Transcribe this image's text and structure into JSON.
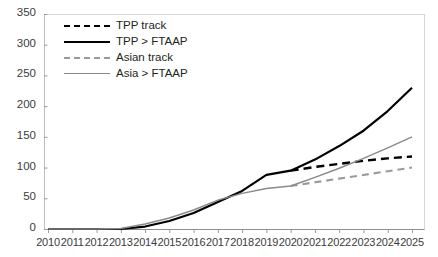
{
  "figure": {
    "clipped_title": "",
    "background_color": "#ffffff"
  },
  "legend": {
    "position": "top-left-inside",
    "items": [
      {
        "label": "TPP track",
        "style": "dashed",
        "color": "#000000",
        "key": "k-dash-black"
      },
      {
        "label": "TPP > FTAAP",
        "style": "solid",
        "color": "#000000",
        "key": "k-solid-black"
      },
      {
        "label": "Asian track",
        "style": "dashed",
        "color": "#9a9a9a",
        "key": "k-dash-gray"
      },
      {
        "label": "Asia > FTAAP",
        "style": "solid",
        "color": "#8a8a8a",
        "key": "k-solid-gray"
      }
    ]
  },
  "axes": {
    "y_ticks": [
      "350",
      "300",
      "250",
      "200",
      "150",
      "100",
      "50",
      "0"
    ],
    "x_ticks": [
      "2010",
      "2011",
      "2012",
      "2013",
      "2014",
      "2015",
      "2016",
      "2017",
      "2018",
      "2019",
      "2020",
      "2021",
      "2022",
      "2023",
      "2024",
      "2025"
    ]
  },
  "chart_data": {
    "type": "line",
    "title": "",
    "xlabel": "",
    "ylabel": "",
    "xlim": [
      2010,
      2025
    ],
    "ylim": [
      0,
      350
    ],
    "y_tick_step": 50,
    "grid": false,
    "legend_position": "top-left-inside",
    "x": [
      2010,
      2011,
      2012,
      2013,
      2014,
      2015,
      2016,
      2017,
      2018,
      2019,
      2020,
      2021,
      2022,
      2023,
      2024,
      2025
    ],
    "series": [
      {
        "name": "TPP track",
        "style": "dashed",
        "color": "#000000",
        "values": [
          null,
          null,
          null,
          null,
          null,
          null,
          null,
          null,
          null,
          null,
          95,
          101,
          106,
          111,
          115,
          118
        ]
      },
      {
        "name": "TPP > FTAAP",
        "style": "solid",
        "color": "#000000",
        "values": [
          0,
          0,
          0,
          0,
          4,
          13,
          26,
          44,
          62,
          88,
          95,
          113,
          135,
          160,
          192,
          230
        ]
      },
      {
        "name": "Asian track",
        "style": "dashed",
        "color": "#9a9a9a",
        "values": [
          null,
          null,
          null,
          null,
          null,
          null,
          null,
          null,
          null,
          null,
          70,
          76,
          82,
          88,
          94,
          100
        ]
      },
      {
        "name": "Asia > FTAAP",
        "style": "solid",
        "color": "#8a8a8a",
        "values": [
          0,
          0,
          0,
          1,
          8,
          18,
          31,
          47,
          58,
          66,
          70,
          84,
          99,
          115,
          132,
          150
        ]
      }
    ]
  }
}
